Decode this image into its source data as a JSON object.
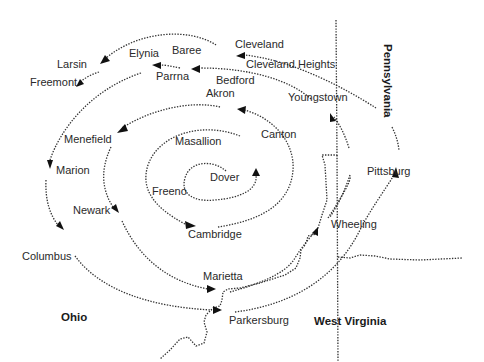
{
  "map": {
    "colors": {
      "background": "#ffffff",
      "ink": "#2a2a2a"
    },
    "states": [
      {
        "id": "ohio",
        "label": "Ohio"
      },
      {
        "id": "west-virginia",
        "label": "West Virginia"
      },
      {
        "id": "pennsylvania",
        "label": "Pennsylvania"
      }
    ],
    "cities": [
      {
        "id": "cleveland",
        "label": "Cleveland"
      },
      {
        "id": "cleveland-heights",
        "label": "Cleveland Heights"
      },
      {
        "id": "baree",
        "label": "Baree"
      },
      {
        "id": "elynia",
        "label": "Elynia"
      },
      {
        "id": "larsin",
        "label": "Larsin"
      },
      {
        "id": "freemont",
        "label": "Freemont"
      },
      {
        "id": "parrna",
        "label": "Parrna"
      },
      {
        "id": "bedford",
        "label": "Bedford"
      },
      {
        "id": "akron",
        "label": "Akron"
      },
      {
        "id": "youngstown",
        "label": "Youngstown"
      },
      {
        "id": "menefield",
        "label": "Menefield"
      },
      {
        "id": "masallion",
        "label": "Masallion"
      },
      {
        "id": "canton",
        "label": "Canton"
      },
      {
        "id": "marion",
        "label": "Marion"
      },
      {
        "id": "dover",
        "label": "Dover"
      },
      {
        "id": "freeno",
        "label": "Freeno"
      },
      {
        "id": "pittsburg",
        "label": "Pittsburg"
      },
      {
        "id": "newark",
        "label": "Newark"
      },
      {
        "id": "cambridge",
        "label": "Cambridge"
      },
      {
        "id": "wheeling",
        "label": "Wheeling"
      },
      {
        "id": "columbus",
        "label": "Columbus"
      },
      {
        "id": "marietta",
        "label": "Marietta"
      },
      {
        "id": "parkersburg",
        "label": "Parkersburg"
      }
    ]
  }
}
